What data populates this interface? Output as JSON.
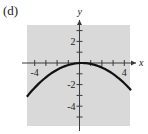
{
  "panel": {
    "label": "(d)"
  },
  "colors": {
    "plot_bg": "#d9d9d9",
    "axis": "#3a3a3a",
    "curve": "#111111"
  },
  "chart_data": {
    "type": "line",
    "title": "",
    "xlabel": "x",
    "ylabel": "y",
    "xlim": [
      -4.7,
      4.6
    ],
    "ylim": [
      -5.8,
      3.5
    ],
    "x_ticks": [
      -4,
      -3,
      -2,
      -1,
      0,
      1,
      2,
      3,
      4
    ],
    "y_ticks": [
      -5,
      -4,
      -3,
      -2,
      -1,
      0,
      1,
      2,
      3
    ],
    "x_tick_labels": {
      "-4": "-4",
      "4": "4"
    },
    "y_tick_labels": {
      "2": "2",
      "-2": "-2",
      "-4": "-4"
    },
    "grid": false,
    "series": [
      {
        "name": "downward parabola",
        "x": [
          -4.7,
          -4,
          -3,
          -2,
          -1,
          0,
          0.2,
          1,
          2,
          3,
          4,
          4.6
        ],
        "y": [
          -3.12,
          -2.37,
          -1.33,
          -0.63,
          -0.19,
          -0.01,
          0,
          -0.08,
          -0.42,
          -1.02,
          -1.5,
          -2.51
        ]
      }
    ]
  }
}
